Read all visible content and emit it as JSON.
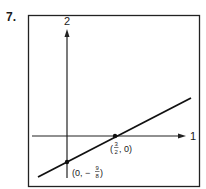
{
  "problem_number": "7.",
  "axes": {
    "horizontal_label": "1",
    "vertical_label": "2"
  },
  "points": [
    {
      "label_prefix": "(",
      "num": "3",
      "den": "2",
      "label_suffix": ", 0)",
      "x": "3/2",
      "y": "0"
    },
    {
      "label_prefix": "(0, −",
      "num": "9",
      "den": "8",
      "label_suffix": ")",
      "x": "0",
      "y": "-9/8"
    }
  ],
  "line": {
    "description": "line through (3/2, 0) and (0, -9/8)"
  }
}
